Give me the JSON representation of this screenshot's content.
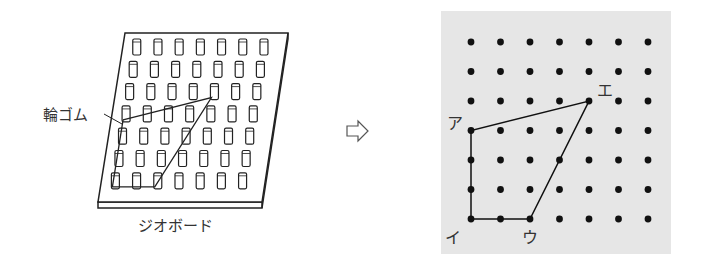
{
  "geoboard": {
    "rubber_band_label": "輪ゴム",
    "caption": "ジオボード",
    "grid_size": 7,
    "band_pegs": [
      [
        0,
        3
      ],
      [
        0,
        6
      ],
      [
        2,
        6
      ],
      [
        4,
        2
      ]
    ]
  },
  "arrow": {
    "icon": "right-arrow-icon",
    "glyph": "⇨"
  },
  "dot_grid": {
    "rows": 7,
    "cols": 7,
    "background": "#e6e6e6",
    "dot_color": "#111111",
    "points": [
      {
        "label": "ア",
        "col": 0,
        "row": 3
      },
      {
        "label": "イ",
        "col": 0,
        "row": 6
      },
      {
        "label": "ウ",
        "col": 2,
        "row": 6
      },
      {
        "label": "エ",
        "col": 4,
        "row": 2
      }
    ]
  }
}
